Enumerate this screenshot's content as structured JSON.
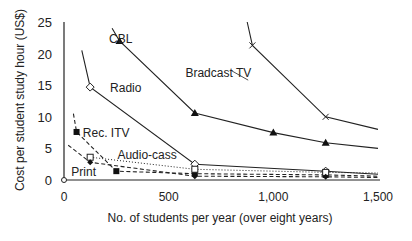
{
  "chart_data": {
    "type": "line",
    "title": "",
    "xlabel": "No. of students per year (over eight years)",
    "ylabel": "Cost per student study hour (US$)",
    "xlim": [
      0,
      1500
    ],
    "ylim": [
      0,
      25
    ],
    "x_ticks": [
      0,
      500,
      1000,
      1500
    ],
    "x_tick_labels": [
      "0",
      "500",
      "1,000",
      "1,500"
    ],
    "y_ticks": [
      0,
      5,
      10,
      15,
      20,
      25
    ],
    "y_tick_labels": [
      "0",
      "5",
      "10",
      "15",
      "20",
      "25"
    ],
    "grid": false,
    "legend": "inline labels",
    "series": [
      {
        "name": "Bradcast TV",
        "marker": "x",
        "style": "solid",
        "points": [
          [
            875,
            25
          ],
          [
            900,
            21.3
          ],
          [
            1250,
            10
          ],
          [
            1500,
            8
          ]
        ]
      },
      {
        "name": "CBL",
        "marker": "filled-triangle",
        "style": "solid",
        "points": [
          [
            230,
            24
          ],
          [
            265,
            22
          ],
          [
            625,
            10.6
          ],
          [
            1000,
            7.5
          ],
          [
            1250,
            5.9
          ],
          [
            1500,
            5.0
          ]
        ]
      },
      {
        "name": "Radio",
        "marker": "open-diamond",
        "style": "solid",
        "points": [
          [
            85,
            20.5
          ],
          [
            125,
            14.7
          ],
          [
            625,
            2.5
          ],
          [
            1250,
            1.4
          ],
          [
            1500,
            0.9
          ]
        ]
      },
      {
        "name": "Rec. ITV",
        "marker": "filled-square",
        "style": "dashed",
        "points": [
          [
            45,
            10.5
          ],
          [
            60,
            7.6
          ],
          [
            250,
            1.4
          ],
          [
            625,
            1.0
          ],
          [
            1250,
            0.8
          ],
          [
            1500,
            0.6
          ]
        ]
      },
      {
        "name": "Audio-cass",
        "marker": "open-square",
        "style": "dotted",
        "points": [
          [
            125,
            3.6
          ],
          [
            625,
            1.7
          ],
          [
            1250,
            1.2
          ],
          [
            1500,
            1.1
          ]
        ]
      },
      {
        "name": "Print",
        "marker": "filled-diamond",
        "style": "dashed",
        "points": [
          [
            20,
            5.5
          ],
          [
            125,
            2.8
          ],
          [
            625,
            0.6
          ],
          [
            1250,
            0.5
          ],
          [
            1500,
            0.4
          ]
        ]
      }
    ],
    "annotations": [
      {
        "text": "CBL",
        "x": 215,
        "y": 22.3
      },
      {
        "text": "Bradcast TV",
        "x": 580,
        "y": 17.0
      },
      {
        "text": "Radio",
        "x": 220,
        "y": 14.6
      },
      {
        "text": "Rec. ITV",
        "x": 90,
        "y": 7.4
      },
      {
        "text": "Audio-cass",
        "x": 255,
        "y": 4.0
      },
      {
        "text": "Print",
        "x": 35,
        "y": 1.2
      }
    ]
  },
  "layout": {
    "x0_px": 64,
    "x1500_px": 378,
    "y0_px": 180,
    "y25_px": 22
  }
}
